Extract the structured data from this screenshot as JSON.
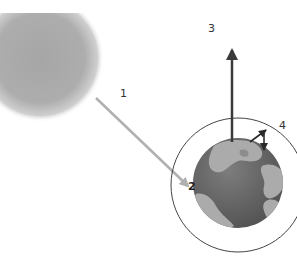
{
  "diagram": {
    "labels": {
      "sunlight_arrow": "1",
      "earth_surface": "2",
      "outgoing_radiation": "3",
      "atmosphere_exchange": "4"
    },
    "elements": {
      "sun": "sun-icon",
      "earth": "earth-globe-icon",
      "atmosphere": "atmosphere-ring",
      "incoming_arrow": "arrow-incoming-sunlight",
      "outgoing_arrow": "arrow-outgoing-up",
      "exchange_arrows": "arrows-atmosphere-exchange"
    },
    "colors": {
      "background": "#ffffff",
      "sun": "#a8a8a8",
      "incoming_arrow": "#b0b0b0",
      "outgoing_arrow": "#3a3a3a",
      "earth_ocean": "#6e6e6e",
      "earth_land": "#aaaaaa",
      "ring": "#444444"
    }
  }
}
